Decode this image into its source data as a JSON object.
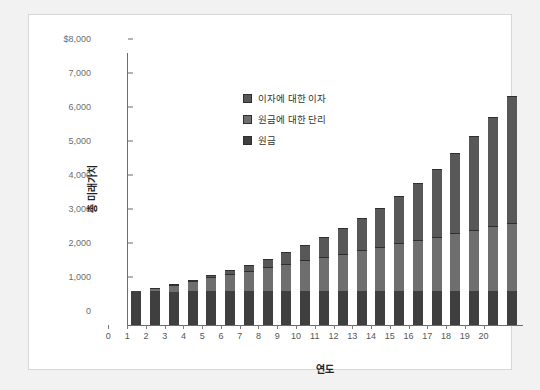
{
  "chart_data": {
    "type": "bar",
    "title": "",
    "xlabel": "연도",
    "ylabel": "총 미래가치",
    "stacked": true,
    "grid": false,
    "legend_position": "inside-top-left",
    "categories": [
      "0",
      "1",
      "2",
      "3",
      "4",
      "5",
      "6",
      "7",
      "8",
      "9",
      "10",
      "11",
      "12",
      "13",
      "14",
      "15",
      "16",
      "17",
      "18",
      "19",
      "20"
    ],
    "x": [
      0,
      1,
      2,
      3,
      4,
      5,
      6,
      7,
      8,
      9,
      10,
      11,
      12,
      13,
      14,
      15,
      16,
      17,
      18,
      19,
      20
    ],
    "ylim": [
      0,
      8000
    ],
    "yticks": [
      0,
      1000,
      2000,
      3000,
      4000,
      5000,
      6000,
      7000,
      8000
    ],
    "ytick_labels": [
      "0",
      "1,000",
      "2,000",
      "3,000",
      "4,000",
      "5,000",
      "6,000",
      "7,000",
      "$8,000"
    ],
    "series": [
      {
        "name": "원금",
        "color": "#3f3f3f",
        "values": [
          1000,
          1000,
          1000,
          1000,
          1000,
          1000,
          1000,
          1000,
          1000,
          1000,
          1000,
          1000,
          1000,
          1000,
          1000,
          1000,
          1000,
          1000,
          1000,
          1000,
          1000
        ]
      },
      {
        "name": "원금에 대한 단리",
        "color": "#6e6e6e",
        "values": [
          0,
          100,
          200,
          300,
          400,
          500,
          600,
          700,
          800,
          900,
          1000,
          1100,
          1200,
          1300,
          1400,
          1500,
          1600,
          1700,
          1800,
          1900,
          2000
        ]
      },
      {
        "name": "이자에 대한 이자",
        "color": "#585858",
        "values": [
          0,
          0,
          10,
          31,
          64,
          111,
          172,
          249,
          344,
          458,
          594,
          753,
          938,
          1152,
          1397,
          1677,
          1995,
          2354,
          2759,
          3213,
          3727
        ]
      }
    ],
    "totals": [
      1000,
      1100,
      1210,
      1331,
      1464,
      1611,
      1772,
      1949,
      2144,
      2358,
      2594,
      2853,
      3138,
      3452,
      3797,
      4177,
      4595,
      5054,
      5559,
      6113,
      6727
    ]
  },
  "legend": {
    "items": [
      {
        "label": "이자에 대한 이자",
        "color": "#585858"
      },
      {
        "label": "원금에 대한 단리",
        "color": "#6e6e6e"
      },
      {
        "label": "원금",
        "color": "#3f3f3f"
      }
    ]
  },
  "axes": {
    "y_title": "총 미래가치",
    "x_title": "연도"
  },
  "colors": {
    "page_background": "#f2f2f2",
    "card_background": "#ffffff",
    "axis": "#6b6b6b",
    "tick_text": "#6d6d6d",
    "title_text": "#222222"
  }
}
